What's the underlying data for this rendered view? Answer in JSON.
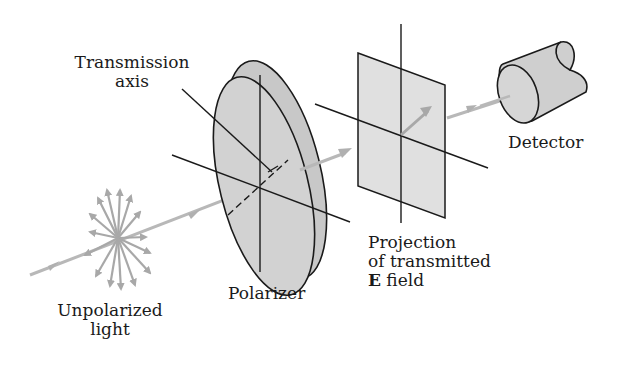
{
  "diagram": {
    "labels": {
      "transmission_axis": [
        "Transmission",
        "axis"
      ],
      "unpolarized_light": [
        "Unpolarized",
        "light"
      ],
      "polarizer": "Polarizer",
      "projection": [
        "Projection",
        "of transmitted"
      ],
      "e_field_symbol": "E",
      "e_field_text": " field",
      "detector": "Detector"
    },
    "colors": {
      "beam": "#b4b4b4",
      "component_fill": "#cfcfcf",
      "panel_fill": "#dedede",
      "line": "#1a1a1a"
    },
    "components": [
      "Unpolarized light source",
      "Polarizer",
      "Projection plane",
      "Detector"
    ]
  }
}
